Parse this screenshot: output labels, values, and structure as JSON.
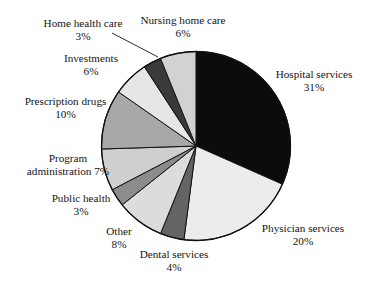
{
  "chart_data": {
    "type": "pie",
    "title": "",
    "subtitle": "",
    "xlabel": "",
    "ylabel": "",
    "grid": false,
    "legend_position": "none",
    "labels_outside": true,
    "unit": "%",
    "start_angle_deg": 0,
    "direction": "clockwise",
    "categories": [
      "Hospital services",
      "Physician services",
      "Dental services",
      "Other",
      "Public health",
      "Program administration",
      "Prescription drugs",
      "Investments",
      "Home health care",
      "Nursing home care"
    ],
    "values": [
      31,
      20,
      4,
      8,
      3,
      7,
      10,
      6,
      3,
      6
    ],
    "slices": [
      {
        "name": "Hospital services",
        "value": 31,
        "label": "Hospital services",
        "value_text": "31%",
        "color": "#0c0c0c"
      },
      {
        "name": "Physician services",
        "value": 20,
        "label": "Physician services",
        "value_text": "20%",
        "color": "#ececec"
      },
      {
        "name": "Dental services",
        "value": 4,
        "label": "Dental services",
        "value_text": "4%",
        "color": "#646464"
      },
      {
        "name": "Other",
        "value": 8,
        "label": "Other",
        "value_text": "8%",
        "color": "#dcdcdc"
      },
      {
        "name": "Public health",
        "value": 3,
        "label": "Public health",
        "value_text": "3%",
        "color": "#8c8c8c"
      },
      {
        "name": "Program administration",
        "value": 7,
        "label": "Program administration",
        "value_text": "7%",
        "color": "#cfcfcf"
      },
      {
        "name": "Prescription drugs",
        "value": 10,
        "label": "Prescription drugs",
        "value_text": "10%",
        "color": "#a8a8a8"
      },
      {
        "name": "Investments",
        "value": 6,
        "label": "Investments",
        "value_text": "6%",
        "color": "#e6e6e6"
      },
      {
        "name": "Home health care",
        "value": 3,
        "label": "Home health care",
        "value_text": "3%",
        "color": "#3a3a3a"
      },
      {
        "name": "Nursing home care",
        "value": 6,
        "label": "Nursing home care",
        "value_text": "6%",
        "color": "#d2d2d2"
      }
    ],
    "colors": {
      "outline": "#111111",
      "background": "#ffffff",
      "text": "#141414"
    }
  },
  "labels": {
    "hospital_services": {
      "line1": "Hospital services",
      "line2": "31%"
    },
    "physician_services": {
      "line1": "Physician services",
      "line2": "20%"
    },
    "dental_services": {
      "line1": "Dental services",
      "line2": "4%"
    },
    "other": {
      "line1": "Other",
      "line2": "8%"
    },
    "public_health": {
      "line1": "Public health",
      "line2": "3%"
    },
    "program_administration": {
      "line1": "Program",
      "line2": "administration 7%"
    },
    "prescription_drugs": {
      "line1": "Prescription drugs",
      "line2": "10%"
    },
    "investments": {
      "line1": "Investments",
      "line2": "6%"
    },
    "home_health_care": {
      "line1": "Home health care",
      "line2": "3%"
    },
    "nursing_home_care": {
      "line1": "Nursing home care",
      "line2": "6%"
    }
  }
}
